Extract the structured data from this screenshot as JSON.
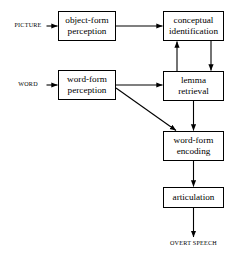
{
  "diagram": {
    "stroke_color": "#000000",
    "background_color": "#ffffff",
    "inputs": [
      {
        "id": "picture",
        "label": "PICTURE"
      },
      {
        "id": "word",
        "label": "WORD"
      }
    ],
    "outputs": [
      {
        "id": "overt-speech",
        "label": "OVERT SPEECH"
      }
    ],
    "nodes": [
      {
        "id": "object-form-perception",
        "line1": "object-form",
        "line2": "perception",
        "x": 58,
        "y": 11,
        "w": 58,
        "h": 30
      },
      {
        "id": "conceptual-identification",
        "line1": "conceptual",
        "line2": "identification",
        "x": 163,
        "y": 11,
        "w": 61,
        "h": 30
      },
      {
        "id": "word-form-perception",
        "line1": "word-form",
        "line2": "perception",
        "x": 58,
        "y": 70,
        "w": 58,
        "h": 30
      },
      {
        "id": "lemma-retrieval",
        "line1": "lemma",
        "line2": "retrieval",
        "x": 163,
        "y": 71,
        "w": 61,
        "h": 30
      },
      {
        "id": "word-form-encoding",
        "line1": "word-form",
        "line2": "encoding",
        "x": 163,
        "y": 131,
        "w": 61,
        "h": 30
      },
      {
        "id": "articulation",
        "line1": "articulation",
        "line2": "",
        "x": 163,
        "y": 187,
        "w": 61,
        "h": 21
      }
    ],
    "edges": [
      {
        "id": "picture-to-object-form-perception",
        "from": "picture",
        "to": "object-form-perception",
        "kind": "horizontal"
      },
      {
        "id": "object-form-perception-to-conceptual-identification",
        "from": "object-form-perception",
        "to": "conceptual-identification",
        "kind": "horizontal"
      },
      {
        "id": "word-to-word-form-perception",
        "from": "word",
        "to": "word-form-perception",
        "kind": "horizontal"
      },
      {
        "id": "word-form-perception-to-lemma-retrieval",
        "from": "word-form-perception",
        "to": "lemma-retrieval",
        "kind": "horizontal"
      },
      {
        "id": "lemma-retrieval-to-conceptual-identification",
        "from": "lemma-retrieval",
        "to": "conceptual-identification",
        "kind": "vertical-up"
      },
      {
        "id": "conceptual-identification-to-lemma-retrieval",
        "from": "conceptual-identification",
        "to": "lemma-retrieval",
        "kind": "vertical-down"
      },
      {
        "id": "word-form-perception-to-word-form-encoding",
        "from": "word-form-perception",
        "to": "word-form-encoding",
        "kind": "diagonal"
      },
      {
        "id": "lemma-retrieval-to-word-form-encoding",
        "from": "lemma-retrieval",
        "to": "word-form-encoding",
        "kind": "vertical-down"
      },
      {
        "id": "word-form-encoding-to-articulation",
        "from": "word-form-encoding",
        "to": "articulation",
        "kind": "vertical-down"
      },
      {
        "id": "articulation-to-overt-speech",
        "from": "articulation",
        "to": "overt-speech",
        "kind": "vertical-down"
      }
    ]
  }
}
